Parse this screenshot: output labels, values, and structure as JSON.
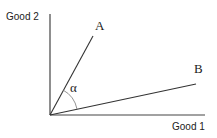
{
  "diagram": {
    "axes": {
      "y_label": "Good 2",
      "x_label": "Good 1"
    },
    "vectors": [
      {
        "label": "A"
      },
      {
        "label": "B"
      }
    ],
    "angle": {
      "label": "α"
    },
    "colors": {
      "line": "#333333",
      "text": "#222222",
      "background": "#ffffff"
    }
  }
}
